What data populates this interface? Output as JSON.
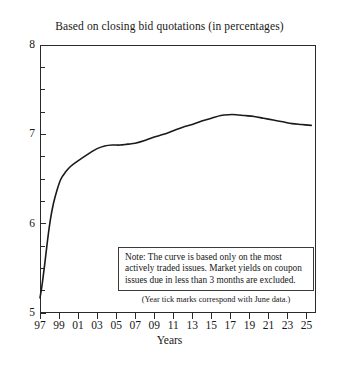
{
  "chart_data": {
    "type": "line",
    "title": "Based on closing bid quotations (in percentages)",
    "xlabel": "Years",
    "ylabel": "",
    "xlim": [
      1997,
      2026
    ],
    "ylim": [
      5,
      8
    ],
    "grid": false,
    "legend": null,
    "x_tick_labels": [
      "97",
      "99",
      "01",
      "03",
      "05",
      "07",
      "09",
      "11",
      "13",
      "15",
      "17",
      "19",
      "21",
      "23",
      "25"
    ],
    "x_tick_values": [
      1997,
      1999,
      2001,
      2003,
      2005,
      2007,
      2009,
      2011,
      2013,
      2015,
      2017,
      2019,
      2021,
      2023,
      2025
    ],
    "y_tick_labels": [
      "5",
      "6",
      "7",
      "8"
    ],
    "y_tick_values": [
      5,
      6,
      7,
      8
    ],
    "y_minor_tick_step": 0.25,
    "series": [
      {
        "name": "Yield curve",
        "x": [
          1997.0,
          1997.2,
          1997.5,
          1997.8,
          1998.1,
          1998.4,
          1998.8,
          1999.2,
          1999.7,
          2000.2,
          2000.8,
          2001.5,
          2002.2,
          2003.0,
          2003.8,
          2004.6,
          2005.4,
          2006.2,
          2007.0,
          2008.0,
          2009.0,
          2010.0,
          2011.0,
          2012.0,
          2013.0,
          2014.0,
          2015.0,
          2016.0,
          2016.8,
          2017.6,
          2018.5,
          2019.5,
          2020.5,
          2021.5,
          2022.5,
          2023.5,
          2024.5,
          2025.5
        ],
        "y": [
          5.17,
          5.3,
          5.55,
          5.82,
          6.05,
          6.22,
          6.38,
          6.5,
          6.58,
          6.64,
          6.69,
          6.74,
          6.79,
          6.84,
          6.87,
          6.88,
          6.88,
          6.89,
          6.9,
          6.93,
          6.97,
          7.0,
          7.04,
          7.08,
          7.11,
          7.15,
          7.18,
          7.21,
          7.22,
          7.22,
          7.21,
          7.2,
          7.18,
          7.16,
          7.14,
          7.12,
          7.11,
          7.1
        ],
        "color": "#1a1a1a",
        "line_width": 1.6
      }
    ]
  },
  "note_box": {
    "lines": [
      "Note: The curve is based only on the most",
      "actively traded issues. Market yields on coupon",
      "issues due in less than 3 months are excluded."
    ]
  },
  "tick_note": "(Year tick marks correspond with June data.)",
  "colors": {
    "curve": "#1a1a1a",
    "axis": "#2a2a2a",
    "text": "#171717",
    "background": "#ffffff"
  }
}
